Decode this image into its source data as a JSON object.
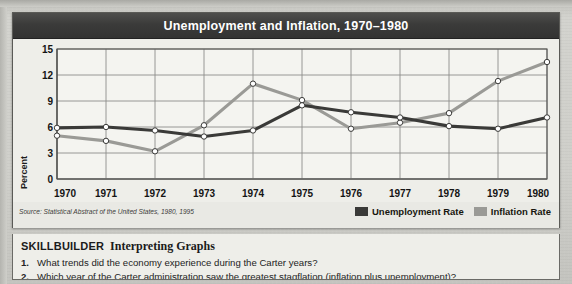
{
  "figure": {
    "title": "Unemployment and Inflation, 1970–1980",
    "source": "Source: Statistical Abstract of the United States, 1980, 1995",
    "legend": [
      {
        "label": "Unemployment Rate",
        "color": "#3a3a38"
      },
      {
        "label": "Inflation Rate",
        "color": "#9a9a96"
      }
    ]
  },
  "skillbuilder": {
    "heading_main": "SKILLBUILDER",
    "heading_sub": "Interpreting Graphs",
    "questions": [
      {
        "num": "1.",
        "text": "What trends did the economy experience during the Carter years?"
      },
      {
        "num": "2.",
        "text": "Which year of the Carter administration saw the greatest stagflation (inflation plus unemployment)?"
      }
    ]
  },
  "chart_data": {
    "type": "line",
    "title": "Unemployment and Inflation, 1970–1980",
    "xlabel": "",
    "ylabel": "Percent",
    "categories": [
      "1970",
      "1971",
      "1972",
      "1973",
      "1974",
      "1975",
      "1976",
      "1977",
      "1978",
      "1979",
      "1980"
    ],
    "x": [
      1970,
      1971,
      1972,
      1973,
      1974,
      1975,
      1976,
      1977,
      1978,
      1979,
      1980
    ],
    "ylim": [
      0,
      15
    ],
    "yticks": [
      0,
      3,
      6,
      9,
      12,
      15
    ],
    "grid": true,
    "legend_position": "bottom-right",
    "markers": "open-circle",
    "series": [
      {
        "name": "Unemployment Rate",
        "color": "#3a3a38",
        "values": [
          5.9,
          6.0,
          5.6,
          4.9,
          5.6,
          8.5,
          7.7,
          7.1,
          6.1,
          5.8,
          7.1
        ]
      },
      {
        "name": "Inflation Rate",
        "color": "#9a9a96",
        "values": [
          5.0,
          4.4,
          3.2,
          6.2,
          11.0,
          9.1,
          5.8,
          6.5,
          7.6,
          11.3,
          13.5
        ]
      }
    ]
  }
}
